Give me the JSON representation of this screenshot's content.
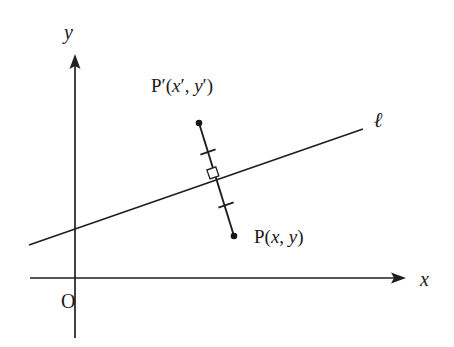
{
  "figure": {
    "kind": "coordinate-geometry-diagram",
    "background_color": "#ffffff",
    "ink_color": "#1f1f22"
  },
  "axes": {
    "x_axis": {
      "label": "x",
      "label_style": "italic",
      "start": [
        30,
        278
      ],
      "end": [
        405,
        278
      ],
      "has_arrow": true,
      "arrow_at": "end"
    },
    "y_axis": {
      "label": "y",
      "label_style": "italic",
      "start": [
        75,
        338
      ],
      "end": [
        75,
        55
      ],
      "has_arrow": true,
      "arrow_at": "end"
    },
    "origin": {
      "label": "O",
      "label_style": "upright",
      "position": [
        75,
        278
      ]
    }
  },
  "line_l": {
    "name": "l",
    "label": "ℓ",
    "label_style": "italic-script",
    "start": [
      29,
      245
    ],
    "end": [
      363,
      129
    ],
    "slope_description": "gently rising left to right"
  },
  "points": [
    {
      "id": "p-prime",
      "label_parts": {
        "name": "P",
        "prime": "′",
        "open": "(",
        "x": "x",
        "x_prime": "′",
        "comma": ", ",
        "y": "y",
        "y_prime": "′",
        "close": ")"
      },
      "label_text": "P′(x′, y′)",
      "dot": [
        199,
        123
      ],
      "side": "above line"
    },
    {
      "id": "p",
      "label_parts": {
        "name": "P",
        "open": "(",
        "x": "x",
        "comma": ", ",
        "y": "y",
        "close": ")"
      },
      "label_text": "P(x, y)",
      "dot": [
        234,
        236
      ],
      "side": "below line"
    }
  ],
  "segment_pp_prime": {
    "from": [
      199,
      123
    ],
    "to": [
      234,
      236
    ],
    "midpoint": [
      216,
      179
    ],
    "perpendicular_to": "l",
    "congruence_ticks": [
      {
        "id": "tick-upper",
        "center": [
          208,
          152
        ]
      },
      {
        "id": "tick-lower",
        "center": [
          226,
          205
        ]
      }
    ],
    "right_angle_marker": {
      "id": "right-angle-square",
      "center": [
        213,
        173
      ],
      "size": 9
    }
  }
}
